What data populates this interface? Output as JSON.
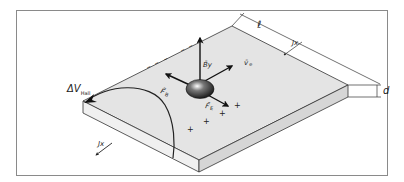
{
  "figure": {
    "frame_color": "#8a8a8a",
    "slab_top_color": "#e4e4e4",
    "slab_front_color": "#f0f0f0",
    "slab_side_color": "#d6d6d6",
    "line_color": "#333333",
    "arrow_color": "#111111"
  },
  "labels": {
    "length": "ℓ",
    "current_right": "Jx",
    "thickness": "d",
    "hall_voltage": "ΔV",
    "hall_voltage_sub": "Hall",
    "current_front": "Jx",
    "magnetic_field": "B̄y",
    "velocity": "v̄",
    "velocity_sub": "e",
    "magnetic_force": "F̄",
    "magnetic_force_sub": "B",
    "electric_force": "F̄",
    "electric_force_sub": "E"
  },
  "charges": {
    "negative_sign": "–",
    "positive_sign": "+"
  }
}
